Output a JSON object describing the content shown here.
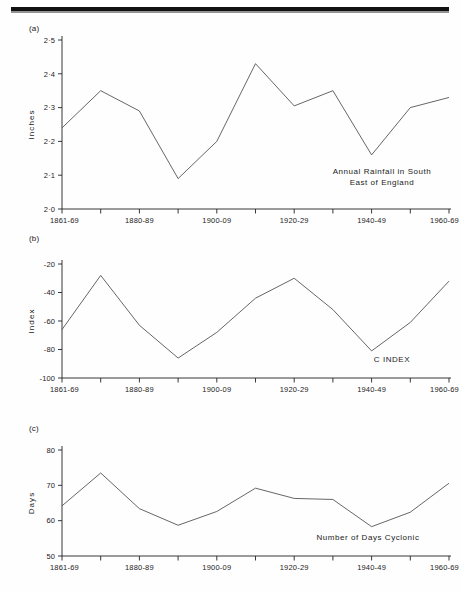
{
  "figure": {
    "background_color": "#fefefe",
    "line_color": "#4a4a4a",
    "axis_color": "#222222",
    "scan_artifact": "black-bar-top"
  },
  "panels": {
    "a": {
      "tag": "(a)"
    },
    "b": {
      "tag": "(b)"
    },
    "c": {
      "tag": "(c)"
    }
  },
  "x_axis": {
    "categories": [
      "1861-69",
      "1870-79",
      "1880-89",
      "1890-99",
      "1900-09",
      "1910-19",
      "1920-29",
      "1930-39",
      "1940-49",
      "1950-59",
      "1960-69"
    ],
    "visible_tick_labels": [
      "1861-69",
      "1880-89",
      "1900-09",
      "1920-29",
      "1940-49",
      "1960-69"
    ],
    "labelled_indices": [
      0,
      2,
      4,
      6,
      8,
      10
    ]
  },
  "chart_data": [
    {
      "type": "line",
      "panel": "(a)",
      "title": "Annual Rainfall in South East of England",
      "annotation_lines": [
        "Annual Rainfall in South",
        "East of England"
      ],
      "xlabel": "",
      "ylabel": "Inches",
      "ylim": [
        2.0,
        2.5
      ],
      "ytick_labels": [
        "2·5",
        "2·4",
        "2·3",
        "2·2",
        "2·1",
        "2·0"
      ],
      "yticks": [
        2.5,
        2.4,
        2.3,
        2.2,
        2.1,
        2.0
      ],
      "grid": false,
      "legend": "none",
      "categories": [
        "1861-69",
        "1870-79",
        "1880-89",
        "1890-99",
        "1900-09",
        "1910-19",
        "1920-29",
        "1930-39",
        "1940-49",
        "1950-59",
        "1960-69"
      ],
      "values": [
        2.24,
        2.35,
        2.29,
        2.09,
        2.2,
        2.43,
        2.305,
        2.35,
        2.16,
        2.3,
        2.33
      ]
    },
    {
      "type": "line",
      "panel": "(b)",
      "title": "C INDEX",
      "annotation_lines": [
        "C  INDEX"
      ],
      "xlabel": "",
      "ylabel": "Index",
      "ylim": [
        -100,
        -20
      ],
      "ytick_labels": [
        "-20",
        "-40",
        "-60",
        "-80",
        "-100"
      ],
      "yticks": [
        -20,
        -40,
        -60,
        -80,
        -100
      ],
      "grid": false,
      "legend": "none",
      "categories": [
        "1861-69",
        "1870-79",
        "1880-89",
        "1890-99",
        "1900-09",
        "1910-19",
        "1920-29",
        "1930-39",
        "1940-49",
        "1950-59",
        "1960-69"
      ],
      "values": [
        -66,
        -28,
        -63,
        -86,
        -68,
        -44,
        -30,
        -52,
        -81,
        -61,
        -32
      ]
    },
    {
      "type": "line",
      "panel": "(c)",
      "title": "Number of Days Cyclonic",
      "annotation_lines": [
        "Number of Days  Cyclonic"
      ],
      "xlabel": "",
      "ylabel": "Days",
      "ylim": [
        50,
        80
      ],
      "ytick_labels": [
        "80",
        "70",
        "60",
        "50"
      ],
      "yticks": [
        80,
        70,
        60,
        50
      ],
      "grid": false,
      "legend": "none",
      "categories": [
        "1861-69",
        "1870-79",
        "1880-89",
        "1890-99",
        "1900-09",
        "1910-19",
        "1920-29",
        "1930-39",
        "1940-49",
        "1950-59",
        "1960-69"
      ],
      "values": [
        64.2,
        73.5,
        63.4,
        58.7,
        62.6,
        69.2,
        66.3,
        66.0,
        58.3,
        62.4,
        70.6
      ]
    }
  ]
}
